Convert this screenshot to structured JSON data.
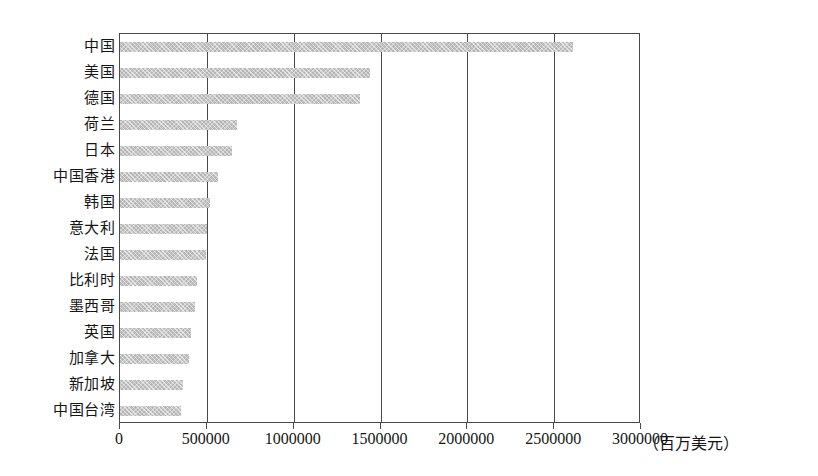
{
  "chart_data": {
    "type": "bar",
    "orientation": "horizontal",
    "title": "",
    "subtitle": "",
    "xlabel": "（百万美元）",
    "ylabel": "",
    "xlim": [
      0,
      3000000
    ],
    "xticks": [
      0,
      500000,
      1000000,
      1500000,
      2000000,
      2500000,
      3000000
    ],
    "xtick_labels": [
      "0",
      "500000",
      "1000000",
      "1500000",
      "2000000",
      "2500000",
      "3000000"
    ],
    "grid": "vertical",
    "legend": "none",
    "bar_color": "#b6b6b6",
    "axis_color": "#4a4a4a",
    "categories": [
      "中国",
      "美国",
      "德国",
      "荷兰",
      "日本",
      "中国香港",
      "韩国",
      "意大利",
      "法国",
      "比利时",
      "墨西哥",
      "英国",
      "加拿大",
      "新加坡",
      "中国台湾"
    ],
    "values": [
      2610000,
      1440000,
      1380000,
      674000,
      645000,
      564000,
      518000,
      501000,
      495000,
      443000,
      432000,
      409000,
      397000,
      363000,
      351000
    ],
    "unit_note": "（百万美元）"
  }
}
